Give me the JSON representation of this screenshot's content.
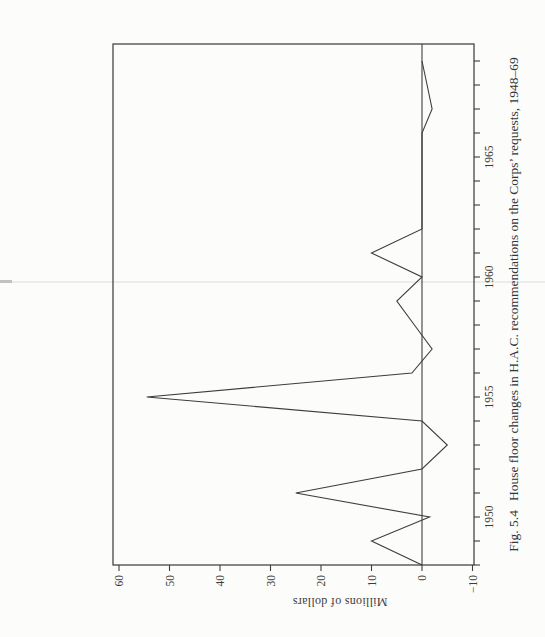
{
  "figure": {
    "caption_fig_label": "Fig. 5.4",
    "caption_text": "House floor changes in H.A.C. recommendations on the Corps’ requests, 1948–69",
    "ylabel": "Millions of dollars"
  },
  "chart_data": {
    "type": "line",
    "xlabel": "",
    "ylabel": "Millions of dollars",
    "x": [
      1948,
      1949,
      1950,
      1951,
      1952,
      1953,
      1954,
      1955,
      1956,
      1957,
      1958,
      1959,
      1960,
      1961,
      1962,
      1963,
      1964,
      1965,
      1966,
      1967,
      1968,
      1969
    ],
    "values": [
      0,
      10,
      -1.5,
      25,
      0,
      -5,
      0,
      54.5,
      2,
      -2,
      1.5,
      5,
      0,
      10,
      0,
      0,
      0,
      0,
      0,
      -2,
      -1,
      0
    ],
    "ylim": [
      -10,
      60
    ],
    "xlim": [
      1948,
      1970
    ],
    "yticks": [
      60,
      50,
      40,
      30,
      20,
      10,
      0,
      -10
    ],
    "ytick_labels": [
      "60",
      "50",
      "40",
      "30",
      "20",
      "10",
      "0",
      "−10"
    ],
    "xticks_every_year": true,
    "xticks_labeled": [
      1950,
      1955,
      1960,
      1965
    ],
    "xtick_label_strings": [
      "1950",
      "1955",
      "1960",
      "1965"
    ],
    "zero_line": true,
    "grid": false,
    "legend": "none",
    "orientation_note": "figure printed rotated 90 degrees counterclockwise on a portrait book page"
  }
}
